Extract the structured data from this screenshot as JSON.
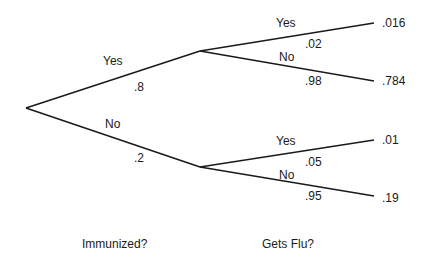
{
  "diagram": {
    "type": "probability-tree",
    "levels": [
      {
        "question": "Immunized?"
      },
      {
        "question": "Gets Flu?"
      }
    ],
    "branches": {
      "immunized_yes": {
        "label": "Yes",
        "prob": ".8"
      },
      "immunized_no": {
        "label": "No",
        "prob": ".2"
      },
      "yes_flu_yes": {
        "label": "Yes",
        "prob": ".02",
        "outcome": ".016"
      },
      "yes_flu_no": {
        "label": "No",
        "prob": ".98",
        "outcome": ".784"
      },
      "no_flu_yes": {
        "label": "Yes",
        "prob": ".05",
        "outcome": ".01"
      },
      "no_flu_no": {
        "label": "No",
        "prob": ".95",
        "outcome": ".19"
      }
    },
    "line_color": "#1a1a1a"
  }
}
